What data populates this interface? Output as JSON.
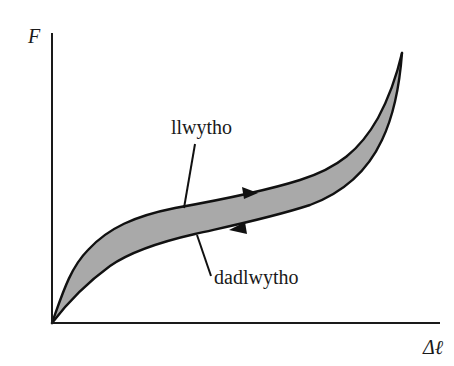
{
  "diagram": {
    "type": "hysteresis-loop",
    "axes": {
      "y_label": "F",
      "x_label": "Δℓ"
    },
    "labels": {
      "loading": "llwytho",
      "unloading": "dadlwytho"
    },
    "colors": {
      "fill": "#a9a9a9",
      "stroke": "#111111",
      "axis": "#1a1a1a",
      "background": "#ffffff"
    },
    "arrows": {
      "loading_direction": "right",
      "unloading_direction": "left"
    }
  }
}
